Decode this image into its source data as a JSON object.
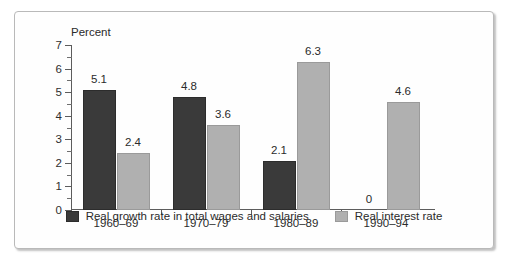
{
  "chart_data": {
    "type": "bar",
    "title": "",
    "xlabel": "",
    "ylabel": "Percent",
    "ylim": [
      0,
      7
    ],
    "ytick_labels": [
      "0",
      "1",
      "2",
      "3",
      "4",
      "5",
      "6",
      "7"
    ],
    "grid": false,
    "legend_position": "bottom",
    "categories": [
      "1960–69",
      "1970–79",
      "1980–89",
      "1990–94"
    ],
    "series": [
      {
        "name": "Real growth rate in total wages and salaries",
        "color": "#3a3a3a",
        "values": [
          5.1,
          4.8,
          2.1,
          0
        ],
        "labels": [
          "5.1",
          "4.8",
          "2.1",
          "0"
        ]
      },
      {
        "name": "Real interest rate",
        "color": "#b0b0b0",
        "values": [
          2.4,
          3.6,
          6.3,
          4.6
        ],
        "labels": [
          "2.4",
          "3.6",
          "6.3",
          "4.6"
        ]
      }
    ]
  },
  "figure": {
    "axis_title": "Percent",
    "frame_color": "#b9b9b9",
    "background": "#fefefe"
  }
}
